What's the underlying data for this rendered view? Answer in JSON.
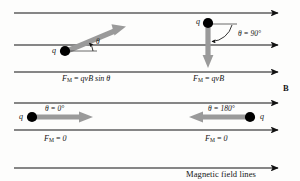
{
  "figure": {
    "caption": "Magnetic field lines",
    "field_label": "B",
    "colors": {
      "field_line": "#111111",
      "velocity_arrow": "#9a9a9a",
      "charge": "#000000",
      "background": "#fdfdfc",
      "text": "#141414"
    }
  },
  "field_lines": {
    "count": 6,
    "direction": "right",
    "y_positions": [
      13,
      45,
      72,
      103,
      130,
      168
    ]
  },
  "panels": [
    {
      "id": "oblique",
      "charge_label": "q",
      "angle_label": "θ",
      "angle_value": "",
      "force_label": "F",
      "force_sub": "M",
      "force_eq": "=",
      "force_value": "qvB sin θ",
      "force_text": "F_M = qvB sin θ",
      "velocity_direction": "up-right"
    },
    {
      "id": "perpendicular",
      "charge_label": "q",
      "angle_label": "θ",
      "angle_value": "90°",
      "angle_text": "θ = 90°",
      "force_label": "F",
      "force_sub": "M",
      "force_eq": "=",
      "force_value": "qvB",
      "force_text": "F_M = qvB",
      "velocity_direction": "down"
    },
    {
      "id": "parallel",
      "charge_label": "q",
      "angle_label": "θ",
      "angle_value": "0°",
      "angle_text": "θ = 0°",
      "force_label": "F",
      "force_sub": "M",
      "force_eq": "=",
      "force_value": "0",
      "force_text": "F_M = 0",
      "velocity_direction": "right"
    },
    {
      "id": "antiparallel",
      "charge_label": "q",
      "angle_label": "θ",
      "angle_value": "180°",
      "angle_text": "θ = 180°",
      "force_label": "F",
      "force_sub": "M",
      "force_eq": "=",
      "force_value": "0",
      "force_text": "F_M = 0",
      "velocity_direction": "left"
    }
  ]
}
